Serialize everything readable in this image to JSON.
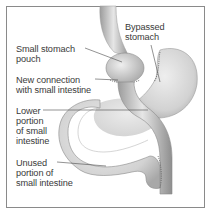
{
  "diagram": {
    "type": "anatomical-illustration",
    "colors": {
      "border": "#8a8a8a",
      "text": "#3a3a3a",
      "organ_fill": "#dcdcdc",
      "organ_shade": "#9a9a9a",
      "leader_line": "#4a4a4a"
    },
    "labels": [
      {
        "id": "small-stomach-pouch",
        "lines": [
          "Small stomach",
          "pouch"
        ]
      },
      {
        "id": "new-connection",
        "lines": [
          "New connection",
          "with small intestine"
        ]
      },
      {
        "id": "lower-portion",
        "lines": [
          "Lower",
          "portion",
          "of small",
          "intestine"
        ]
      },
      {
        "id": "unused-portion",
        "lines": [
          "Unused",
          "portion of",
          "small intestine"
        ]
      },
      {
        "id": "bypassed-stomach",
        "lines": [
          "Bypassed",
          "stomach"
        ]
      }
    ]
  }
}
